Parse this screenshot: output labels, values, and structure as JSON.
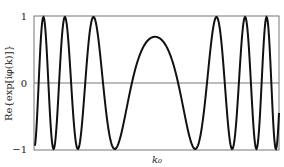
{
  "chart_data": {
    "type": "line",
    "title": "",
    "xlabel": "k₀",
    "ylabel": "Re{exp[iφ(k)]}",
    "ylim": [
      -1,
      1
    ],
    "yticks": [
      "1",
      "0",
      "−1"
    ],
    "grid": false,
    "legend": null,
    "series": [
      {
        "name": "Re{exp[iφ(k)]}",
        "x_pixels_minima": [
          41,
          59,
          81,
          116,
          195,
          230,
          253,
          271
        ],
        "x_pixels_maxima": [
          50,
          69,
          96,
          155,
          217,
          243,
          263
        ],
        "center_peak_value": 0.7
      }
    ]
  },
  "axes": {
    "y_tick_top": "1",
    "y_tick_mid": "0",
    "y_tick_bottom": "−1",
    "x_label": "k₀",
    "y_label": "Re{exp[iφ(k)]}"
  }
}
